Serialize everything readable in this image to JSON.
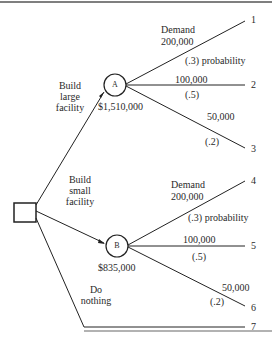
{
  "diagram": {
    "type": "decision-tree",
    "decision_node": {
      "shape": "square"
    },
    "branches": [
      {
        "label_lines": [
          "Build",
          "large",
          "facility"
        ],
        "node": "A",
        "value": "$1,510,000"
      },
      {
        "label_lines": [
          "Build",
          "small",
          "facility"
        ],
        "node": "B",
        "value": "$835,000"
      },
      {
        "label_lines": [
          "Do",
          "nothing"
        ],
        "outcome": "7"
      }
    ],
    "chance_nodes": {
      "A": {
        "letter": "A",
        "value": "$1,510,000",
        "outcomes": [
          {
            "demand_label": "Demand",
            "demand": "200,000",
            "probability": "(.3) probability",
            "end": "1"
          },
          {
            "demand": "100,000",
            "probability": "(.5)",
            "end": "2"
          },
          {
            "demand": "50,000",
            "probability": "(.2)",
            "end": "3"
          }
        ]
      },
      "B": {
        "letter": "B",
        "value": "$835,000",
        "outcomes": [
          {
            "demand_label": "Demand",
            "demand": "200,000",
            "probability": "(.3) probability",
            "end": "4"
          },
          {
            "demand": "100,000",
            "probability": "(.5)",
            "end": "5"
          },
          {
            "demand": "50,000",
            "probability": "(.2)",
            "end": "6"
          }
        ]
      }
    },
    "nothing_end": "7"
  }
}
